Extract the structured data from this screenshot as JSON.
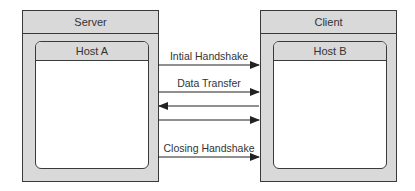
{
  "left_panel": {
    "title": "Server",
    "host": "Host A"
  },
  "right_panel": {
    "title": "Client",
    "host": "Host B"
  },
  "messages": [
    {
      "label": "Intial Handshake",
      "direction": "right"
    },
    {
      "label": "Data Transfer",
      "direction": "right"
    },
    {
      "label": "",
      "direction": "left"
    },
    {
      "label": "",
      "direction": "right"
    },
    {
      "label": "Closing Handshake",
      "direction": "right"
    }
  ],
  "colors": {
    "panel_fill": "#d9d9d9",
    "stroke": "#3a3a3a",
    "inner_fill": "#ffffff"
  }
}
